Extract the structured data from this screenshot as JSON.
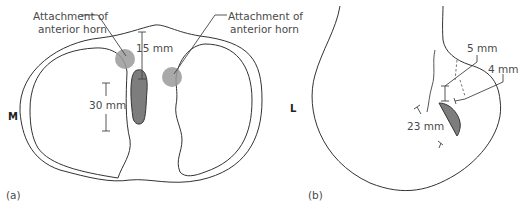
{
  "panels": {
    "a": {
      "label": "(a)",
      "left_label": "M",
      "right_label": "L",
      "callout_left_line1": "Attachment of",
      "callout_left_line2": "anterior horn",
      "callout_right_line1": "Attachment of",
      "callout_right_line2": "anterior horn",
      "measure_top": "15 mm",
      "measure_left": "30 mm"
    },
    "b": {
      "label": "(b)",
      "measure_5": "5 mm",
      "measure_4": "4 mm",
      "measure_23": "23 mm"
    }
  },
  "colors": {
    "outline": "#333333",
    "shaded": "#7d7d7d",
    "circle": "#9a9a9a",
    "text": "#4a4a4a"
  }
}
